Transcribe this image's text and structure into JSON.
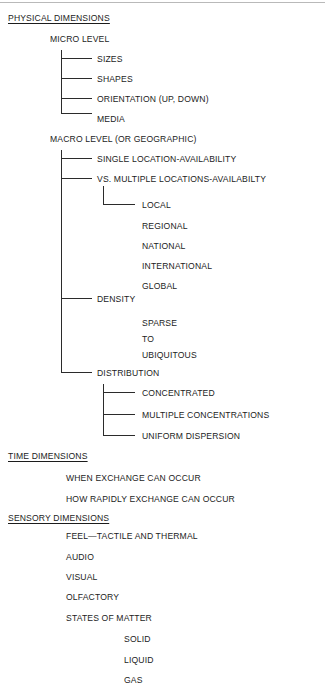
{
  "diagram": {
    "title": "PHYSICAL DIMENSIONS",
    "type": "hierarchy-tree",
    "sections": [
      {
        "header": "PHYSICAL DIMENSIONS",
        "children": [
          {
            "label": "MICRO LEVEL",
            "children": [
              {
                "label": "SIZES"
              },
              {
                "label": "SHAPES"
              },
              {
                "label": "ORIENTATION (UP, DOWN)"
              },
              {
                "label": "MEDIA"
              }
            ]
          },
          {
            "label": "MACRO LEVEL (OR GEOGRAPHIC)",
            "children": [
              {
                "label": "SINGLE LOCATION-AVAILABILITY"
              },
              {
                "label": "VS. MULTIPLE LOCATIONS-AVAILABILTY",
                "children": [
                  {
                    "label": "LOCAL"
                  },
                  {
                    "label": "REGIONAL"
                  },
                  {
                    "label": "NATIONAL"
                  },
                  {
                    "label": "INTERNATIONAL"
                  },
                  {
                    "label": "GLOBAL"
                  }
                ]
              },
              {
                "label": "DENSITY",
                "children": [
                  {
                    "label": "SPARSE"
                  },
                  {
                    "label": "TO"
                  },
                  {
                    "label": "UBIQUITOUS"
                  }
                ]
              },
              {
                "label": "DISTRIBUTION",
                "children": [
                  {
                    "label": "CONCENTRATED"
                  },
                  {
                    "label": "MULTIPLE CONCENTRATIONS"
                  },
                  {
                    "label": "UNIFORM DISPERSION"
                  }
                ]
              }
            ]
          }
        ]
      },
      {
        "header": "TIME DIMENSIONS",
        "children": [
          {
            "label": "WHEN EXCHANGE CAN OCCUR"
          },
          {
            "label": "HOW RAPIDLY EXCHANGE CAN OCCUR"
          }
        ]
      },
      {
        "header": "SENSORY DIMENSIONS",
        "children": [
          {
            "label": "FEEL—TACTILE AND THERMAL"
          },
          {
            "label": "AUDIO"
          },
          {
            "label": "VISUAL"
          },
          {
            "label": "OLFACTORY"
          },
          {
            "label": "STATES OF MATTER",
            "children": [
              {
                "label": "SOLID"
              },
              {
                "label": "LIQUID"
              },
              {
                "label": "GAS"
              }
            ]
          }
        ]
      }
    ]
  },
  "nodes": {
    "physical_dimensions": "PHYSICAL DIMENSIONS",
    "micro_level": "MICRO LEVEL",
    "sizes": "SIZES",
    "shapes": "SHAPES",
    "orientation": "ORIENTATION (UP, DOWN)",
    "media": "MEDIA",
    "macro_level": "MACRO LEVEL (OR GEOGRAPHIC)",
    "single_location": "SINGLE LOCATION-AVAILABILITY",
    "multiple_locations": "VS. MULTIPLE LOCATIONS-AVAILABILTY",
    "local": "LOCAL",
    "regional": "REGIONAL",
    "national": "NATIONAL",
    "international": "INTERNATIONAL",
    "global": "GLOBAL",
    "density": "DENSITY",
    "sparse": "SPARSE",
    "to": "TO",
    "ubiquitous": "UBIQUITOUS",
    "distribution": "DISTRIBUTION",
    "concentrated": "CONCENTRATED",
    "multiple_concentrations": "MULTIPLE CONCENTRATIONS",
    "uniform_dispersion": "UNIFORM DISPERSION",
    "time_dimensions": "TIME DIMENSIONS",
    "when_exchange": "WHEN EXCHANGE CAN OCCUR",
    "how_rapidly": "HOW RAPIDLY EXCHANGE CAN OCCUR",
    "sensory_dimensions": "SENSORY DIMENSIONS",
    "feel_tactile": "FEEL—TACTILE AND THERMAL",
    "audio": "AUDIO",
    "visual": "VISUAL",
    "olfactory": "OLFACTORY",
    "states_of_matter": "STATES OF MATTER",
    "solid": "SOLID",
    "liquid": "LIQUID",
    "gas": "GAS"
  },
  "colors": {
    "text": "#1c1c1c",
    "line": "#2b2b2b",
    "top_rule": "#b9b9b9",
    "background": "#ffffff"
  }
}
